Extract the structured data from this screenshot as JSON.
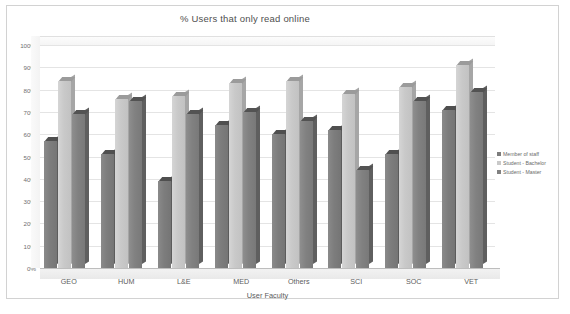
{
  "chart_data": {
    "type": "bar",
    "title": "% Users that only read online",
    "xlabel": "User Faculty",
    "ylabel": "",
    "ylim": [
      0,
      100
    ],
    "ytick_labels": [
      "100%",
      "90%",
      "80%",
      "70%",
      "60%",
      "50%",
      "40%",
      "30%",
      "20%",
      "10%",
      "0%"
    ],
    "grid": true,
    "legend_position": "right",
    "categories": [
      "GEO",
      "HUM",
      "L&E",
      "MED",
      "Others",
      "SCI",
      "SOC",
      "VET"
    ],
    "series": [
      {
        "name": "Member of staff",
        "color": "#7d7d7d",
        "values": [
          57,
          51,
          39,
          64,
          60,
          62,
          51,
          71
        ]
      },
      {
        "name": "Student - Bachelor",
        "color": "#c9c9c9",
        "values": [
          84,
          76,
          77,
          83,
          84,
          78,
          81,
          91
        ]
      },
      {
        "name": "Student - Master",
        "color": "#818181",
        "values": [
          69,
          75,
          69,
          70,
          66,
          44,
          75,
          79
        ]
      }
    ]
  },
  "legend": {
    "items": [
      {
        "label": "Member of staff"
      },
      {
        "label": "Student - Bachelor"
      },
      {
        "label": "Student - Master"
      }
    ]
  }
}
